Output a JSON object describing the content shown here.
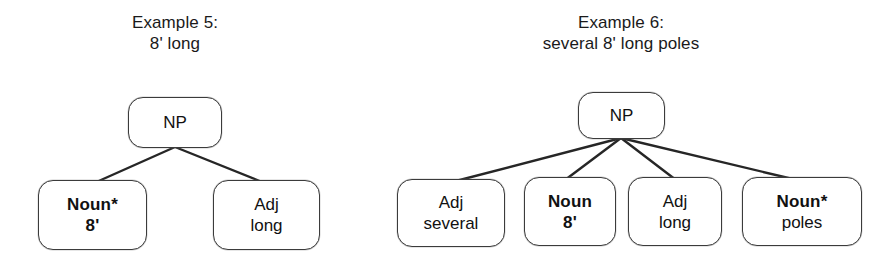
{
  "figure": {
    "kind": "syntax-tree-pair",
    "ink_color": "#1a1a1a",
    "node_border_color": "#3b3b3b",
    "background": "#ffffff"
  },
  "trees": [
    {
      "id": "example-5",
      "title_line1": "Example 5:",
      "title_line2": "8' long",
      "root": {
        "label": "NP",
        "bold": false
      },
      "leaves": [
        {
          "line1": "Noun*",
          "line2": "8'",
          "line1_bold": true,
          "line2_bold": true
        },
        {
          "line1": "Adj",
          "line2": "long",
          "line1_bold": false,
          "line2_bold": false
        }
      ]
    },
    {
      "id": "example-6",
      "title_line1": "Example 6:",
      "title_line2": "several 8' long poles",
      "root": {
        "label": "NP",
        "bold": false
      },
      "leaves": [
        {
          "line1": "Adj",
          "line2": "several",
          "line1_bold": false,
          "line2_bold": false
        },
        {
          "line1": "Noun",
          "line2": "8'",
          "line1_bold": true,
          "line2_bold": true
        },
        {
          "line1": "Adj",
          "line2": "long",
          "line1_bold": false,
          "line2_bold": false
        },
        {
          "line1": "Noun*",
          "line2": "poles",
          "line1_bold": true,
          "line2_bold": false
        }
      ]
    }
  ]
}
